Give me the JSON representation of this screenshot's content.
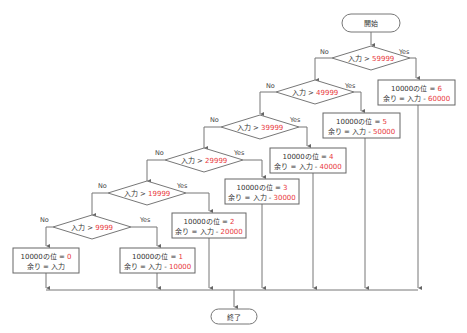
{
  "flowchart": {
    "start": "開始",
    "end": "終了",
    "yes_label": "Yes",
    "no_label": "No",
    "input_label": "入力",
    "gt": ">",
    "accent_color": "#e8383d",
    "decisions": [
      {
        "threshold": "59999"
      },
      {
        "threshold": "49999"
      },
      {
        "threshold": "39999"
      },
      {
        "threshold": "29999"
      },
      {
        "threshold": "19999"
      },
      {
        "threshold": "9999"
      }
    ],
    "results": [
      {
        "line1_prefix": "10000の位 = ",
        "digit": "6",
        "line2_prefix": "余り = 入力 - ",
        "subtract": "60000"
      },
      {
        "line1_prefix": "10000の位 = ",
        "digit": "5",
        "line2_prefix": "余り = 入力 - ",
        "subtract": "50000"
      },
      {
        "line1_prefix": "10000の位 = ",
        "digit": "4",
        "line2_prefix": "余り = 入力 - ",
        "subtract": "40000"
      },
      {
        "line1_prefix": "10000の位 = ",
        "digit": "3",
        "line2_prefix": "余り = 入力 - ",
        "subtract": "30000"
      },
      {
        "line1_prefix": "10000の位 = ",
        "digit": "2",
        "line2_prefix": "余り = 入力 - ",
        "subtract": "20000"
      },
      {
        "line1_prefix": "10000の位 = ",
        "digit": "1",
        "line2_prefix": "余り = 入力 - ",
        "subtract": "10000"
      },
      {
        "line1_prefix": "10000の位 = ",
        "digit": "0",
        "line2_prefix": "余り = 入力",
        "subtract": ""
      }
    ]
  }
}
